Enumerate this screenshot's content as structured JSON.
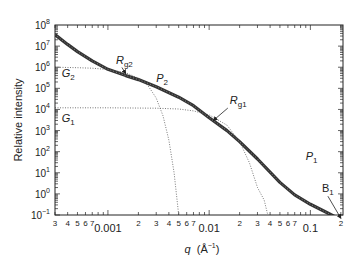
{
  "chart_data": {
    "type": "line",
    "title": "",
    "xlabel": "q (Å⁻¹)",
    "xlabel_parts": {
      "var": "q",
      "unit": "(Å",
      "exp": "−1",
      "close": ")"
    },
    "ylabel": "Relative intensity",
    "xscale": "log",
    "yscale": "log",
    "xlim": [
      0.0003,
      0.21
    ],
    "ylim": [
      0.1,
      100000000
    ],
    "grid": false,
    "legend": "none",
    "x_tick_labels": [
      {
        "q": 0.0003,
        "label": "3"
      },
      {
        "q": 0.0004,
        "label": "4"
      },
      {
        "q": 0.0005,
        "label": "5"
      },
      {
        "q": 0.0006,
        "label": "6"
      },
      {
        "q": 0.0007,
        "label": "7"
      },
      {
        "q": 0.001,
        "label": "0.001"
      },
      {
        "q": 0.002,
        "label": "2"
      },
      {
        "q": 0.003,
        "label": "3"
      },
      {
        "q": 0.004,
        "label": "4"
      },
      {
        "q": 0.005,
        "label": "5"
      },
      {
        "q": 0.006,
        "label": "6"
      },
      {
        "q": 0.007,
        "label": "7"
      },
      {
        "q": 0.01,
        "label": "0.01"
      },
      {
        "q": 0.02,
        "label": "2"
      },
      {
        "q": 0.03,
        "label": "3"
      },
      {
        "q": 0.04,
        "label": "4"
      },
      {
        "q": 0.05,
        "label": "5"
      },
      {
        "q": 0.06,
        "label": "6"
      },
      {
        "q": 0.07,
        "label": "7"
      },
      {
        "q": 0.1,
        "label": "0.1"
      },
      {
        "q": 0.2,
        "label": "2"
      }
    ],
    "y_tick_labels": [
      {
        "exp": 8
      },
      {
        "exp": 7
      },
      {
        "exp": 6
      },
      {
        "exp": 5
      },
      {
        "exp": 4
      },
      {
        "exp": 3
      },
      {
        "exp": 2
      },
      {
        "exp": 1
      },
      {
        "exp": 0
      },
      {
        "exp": -1
      }
    ],
    "series": [
      {
        "name": "Data / unified fit",
        "style": "thick-solid-markers",
        "x": [
          0.0003,
          0.0004,
          0.0005,
          0.0007,
          0.001,
          0.0015,
          0.002,
          0.003,
          0.005,
          0.007,
          0.01,
          0.015,
          0.02,
          0.03,
          0.05,
          0.07,
          0.1,
          0.15,
          0.2
        ],
        "values": [
          35000000.0,
          12000000.0,
          5500000.0,
          2000000.0,
          800000.0,
          400000.0,
          260000.0,
          120000.0,
          38000.0,
          15000.0,
          4000.0,
          1000.0,
          300.0,
          45.0,
          3.5,
          0.9,
          0.32,
          0.12,
          0.06
        ]
      },
      {
        "name": "G2 (Guinier level 2)",
        "style": "dotted",
        "x": [
          0.0003,
          0.0005,
          0.0007,
          0.001,
          0.0015,
          0.002,
          0.0025,
          0.003,
          0.0035,
          0.004,
          0.0045,
          0.005
        ],
        "values": [
          1000000.0,
          950000.0,
          900000.0,
          780000.0,
          550000.0,
          300000.0,
          130000.0,
          35000.0,
          5000.0,
          350.0,
          10.0,
          0.1
        ]
      },
      {
        "name": "G1 (Guinier level 1)",
        "style": "dotted",
        "x": [
          0.0003,
          0.001,
          0.003,
          0.005,
          0.007,
          0.01,
          0.015,
          0.02,
          0.025,
          0.03,
          0.035,
          0.038
        ],
        "values": [
          12000.0,
          12000.0,
          11500.0,
          10500.0,
          8500.0,
          5500.0,
          1800.0,
          300.0,
          30.0,
          2.0,
          0.5,
          0.1
        ]
      }
    ],
    "annotations": [
      {
        "id": "G2",
        "text": "G",
        "sub": "2",
        "x": 0.00035,
        "y": 350000.0
      },
      {
        "id": "G1",
        "text": "G",
        "sub": "1",
        "x": 0.00035,
        "y": 2500.0
      },
      {
        "id": "Rg2",
        "text": "R",
        "sub": "g2",
        "x": 0.0012,
        "y": 1500000.0,
        "arrow_to": [
          0.0015,
          500000.0
        ]
      },
      {
        "id": "P2",
        "text": "P",
        "sub": "2",
        "x": 0.003,
        "y": 200000.0
      },
      {
        "id": "Rg1",
        "text": "R",
        "sub": "g1",
        "x": 0.016,
        "y": 18000.0,
        "arrow_to": [
          0.011,
          3000.0
        ]
      },
      {
        "id": "P1",
        "text": "P",
        "sub": "1",
        "x": 0.09,
        "y": 40.0
      },
      {
        "id": "B1",
        "text": "B",
        "sub": "1",
        "x": 0.13,
        "y": 1.2,
        "arrow_to": [
          0.2,
          0.07
        ]
      }
    ]
  }
}
